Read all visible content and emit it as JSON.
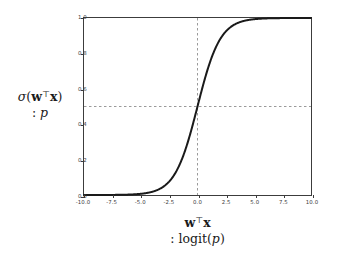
{
  "figure": {
    "background_color": "#ffffff",
    "frame_color": "#3c3c3c"
  },
  "chart_data": {
    "type": "line",
    "title": "",
    "subtitle": "",
    "xlabel": "wᵀx : logit(p)",
    "ylabel": "σ(wᵀx) : p",
    "xlim": [
      -10.0,
      10.0
    ],
    "ylim": [
      0.0,
      1.0
    ],
    "grid": false,
    "legend": null,
    "legend_position": "none",
    "line_color": "#1a1a1a",
    "line_width": 2.0,
    "function": "logistic sigmoid  y = 1 / (1 + exp(-x))",
    "xticks": [
      -10.0,
      -7.5,
      -5.0,
      -2.5,
      0.0,
      2.5,
      5.0,
      7.5,
      10.0
    ],
    "xtick_labels": [
      "-10.0",
      "-7.5",
      "-5.0",
      "-2.5",
      "0.0",
      "2.5",
      "5.0",
      "7.5",
      "10.0"
    ],
    "yticks": [
      0.0,
      0.2,
      0.4,
      0.6,
      0.8,
      1.0
    ],
    "ytick_labels": [
      "0.0",
      "0.2",
      "0.4",
      "0.6",
      "0.8",
      "1.0"
    ],
    "x": [
      -10.0,
      -9.5,
      -9.0,
      -8.5,
      -8.0,
      -7.5,
      -7.0,
      -6.5,
      -6.0,
      -5.5,
      -5.0,
      -4.5,
      -4.0,
      -3.5,
      -3.0,
      -2.5,
      -2.0,
      -1.5,
      -1.0,
      -0.5,
      0.0,
      0.5,
      1.0,
      1.5,
      2.0,
      2.5,
      3.0,
      3.5,
      4.0,
      4.5,
      5.0,
      5.5,
      6.0,
      6.5,
      7.0,
      7.5,
      8.0,
      8.5,
      9.0,
      9.5,
      10.0
    ],
    "y": [
      4.54e-05,
      7.49e-05,
      0.0001234,
      0.0002035,
      0.0003354,
      0.0005527,
      0.0009111,
      0.0015012,
      0.0024726,
      0.0040701,
      0.0066929,
      0.0109869,
      0.0179862,
      0.0293122,
      0.0474259,
      0.0758582,
      0.1192029,
      0.1824255,
      0.2689414,
      0.3775407,
      0.5,
      0.6224593,
      0.7310586,
      0.8175745,
      0.8807971,
      0.9241418,
      0.9525741,
      0.9706878,
      0.9820138,
      0.9890131,
      0.9933071,
      0.9959299,
      0.9975274,
      0.9984988,
      0.9990889,
      0.9994473,
      0.9996646,
      0.9997965,
      0.9998766,
      0.9999251,
      0.9999546
    ],
    "annotations": [
      {
        "name": "vertical-crosshair",
        "type": "vline",
        "x": 0.0,
        "style": "dashed",
        "color": "#9a9a9a"
      },
      {
        "name": "horizontal-crosshair",
        "type": "hline",
        "y": 0.5,
        "style": "dashed",
        "color": "#9a9a9a"
      }
    ]
  },
  "ylabel": {
    "line1_sigma": "σ",
    "line1_open": "(",
    "line1_w": "w",
    "line1_T": "⊤",
    "line1_x": "x",
    "line1_close": ")",
    "line2_colon": ":",
    "line2_p": "p"
  },
  "xlabel": {
    "line1_w": "w",
    "line1_T": "⊤",
    "line1_x": "x",
    "line2_colon": ":",
    "line2_logit": "logit(",
    "line2_p": "p",
    "line2_close": ")"
  }
}
